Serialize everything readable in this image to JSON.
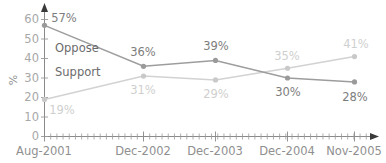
{
  "chart_data": {
    "type": "line",
    "title": "",
    "xlabel": "",
    "ylabel": "%",
    "categories": [
      "Aug-2001",
      "Dec-2002",
      "Dec-2003",
      "Dec-2004",
      "Nov-2005"
    ],
    "ylim": [
      0,
      60
    ],
    "ytick_values": [
      0,
      10,
      20,
      30,
      40,
      50,
      60
    ],
    "ytick_labels": [
      "0",
      "10",
      "20",
      "30",
      "40",
      "50",
      "60"
    ],
    "grid": false,
    "legend": "inline-labels",
    "series": [
      {
        "name": "Oppose",
        "color": "#9d9d9d",
        "label_color": "#7d7d7d",
        "values": [
          57,
          36,
          39,
          30,
          28
        ],
        "point_labels": [
          "57%",
          "36%",
          "39%",
          "30%",
          "28%"
        ]
      },
      {
        "name": "Support",
        "color": "#d2d2d2",
        "label_color": "#cfcfcf",
        "values": [
          19,
          31,
          29,
          35,
          41
        ],
        "point_labels": [
          "19%",
          "31%",
          "29%",
          "35%",
          "41%"
        ]
      }
    ]
  },
  "axes": {
    "y_axis_title": "%",
    "y_tick_labels": [
      "60",
      "50",
      "40",
      "30",
      "20",
      "10",
      "0"
    ],
    "x_tick_labels": [
      "Aug-2001",
      "Dec-2002",
      "Dec-2003",
      "Dec-2004",
      "Nov-2005"
    ]
  },
  "series_labels": {
    "oppose": "Oppose",
    "support": "Support"
  },
  "point_labels": {
    "oppose": [
      "57%",
      "36%",
      "39%",
      "30%",
      "28%"
    ],
    "support": [
      "19%",
      "31%",
      "29%",
      "35%",
      "41%"
    ]
  },
  "colors": {
    "oppose_line": "#9d9d9d",
    "support_line": "#d2d2d2",
    "axis": "#8a8a8a",
    "tick_text": "#a8a8a8",
    "background": "#ffffff"
  }
}
